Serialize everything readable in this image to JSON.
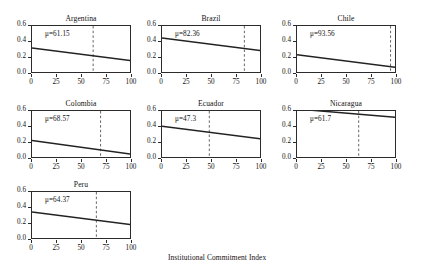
{
  "chart_data": {
    "type": "line",
    "title": "",
    "xlabel": "Institutional Commitment Index",
    "ylabel": "Reliance on executive decrees",
    "xlim": [
      0,
      100
    ],
    "ylim": [
      0.0,
      0.6
    ],
    "xticks": [
      0,
      25,
      50,
      75,
      100
    ],
    "xtick_labels": [
      "0",
      "25",
      "50",
      "75",
      "100"
    ],
    "yticks": [
      0.0,
      0.2,
      0.4,
      0.6
    ],
    "ytick_labels": [
      "0.0",
      "0.2",
      "0.4",
      "0.6"
    ],
    "grid": false,
    "legend": "none",
    "layout": {
      "rows": 3,
      "cols": 3,
      "panels_used": 7
    },
    "annotation_note": "Each panel shows a downward-sloping fitted line with a vertical dashed reference line at the country mean (mu) of the Institutional Commitment Index.",
    "panels": [
      {
        "name": "Argentina",
        "mu_label": "μ=61.15",
        "mu": 61.15,
        "x": [
          0,
          100
        ],
        "y": [
          0.325,
          0.165
        ],
        "vline_x": 61.15
      },
      {
        "name": "Brazil",
        "mu_label": "μ=82.36",
        "mu": 82.36,
        "x": [
          0,
          100
        ],
        "y": [
          0.45,
          0.29
        ],
        "vline_x": 82.36
      },
      {
        "name": "Chile",
        "mu_label": "μ=93.56",
        "mu": 93.56,
        "x": [
          0,
          100
        ],
        "y": [
          0.24,
          0.08
        ],
        "vline_x": 93.56
      },
      {
        "name": "Colombia",
        "mu_label": "μ=68.57",
        "mu": 68.57,
        "x": [
          0,
          100
        ],
        "y": [
          0.23,
          0.06
        ],
        "vline_x": 68.57
      },
      {
        "name": "Ecuador",
        "mu_label": "μ=47.3",
        "mu": 47.3,
        "x": [
          0,
          100
        ],
        "y": [
          0.41,
          0.25
        ],
        "vline_x": 47.3
      },
      {
        "name": "Nicaragua",
        "mu_label": "μ=61.7",
        "mu": 61.7,
        "x": [
          0,
          100
        ],
        "y": [
          0.625,
          0.52
        ],
        "vline_x": 61.7
      },
      {
        "name": "Peru",
        "mu_label": "μ=64.37",
        "mu": 64.37,
        "x": [
          0,
          100
        ],
        "y": [
          0.35,
          0.19
        ],
        "vline_x": 64.37
      }
    ]
  },
  "colors": {
    "line": "#222222",
    "axis": "#2b2b2b",
    "dashed": "#555555",
    "background": "#ffffff"
  }
}
